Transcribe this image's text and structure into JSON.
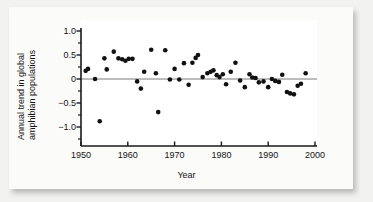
{
  "figure": {
    "background_color": "#f2f2f0",
    "card_color": "#fbfbfa",
    "plot_background": "#ffffff",
    "marker_color": "#111111",
    "axis_color": "#1a1a1a",
    "zero_line_color": "#7a7a7a"
  },
  "chart_data": {
    "type": "scatter",
    "title": "",
    "xlabel": "Year",
    "ylabel": "Annual trend in global amphibian populations",
    "xlim": [
      1950,
      2000
    ],
    "ylim": [
      -1.25,
      1.05
    ],
    "xticks": [
      1950,
      1960,
      1970,
      1980,
      1990,
      2000
    ],
    "xticklabels": [
      "1950",
      "1960",
      "1970",
      "1980",
      "1990",
      "2000"
    ],
    "yticks": [
      1.0,
      0.5,
      0,
      -0.5,
      -1.0
    ],
    "yticklabels": [
      "1.0",
      "0.5",
      "0",
      "−0.5",
      "−1.0"
    ],
    "y_minor_ticks": [
      0.75,
      0.25,
      -0.25,
      -0.75
    ],
    "grid": false,
    "legend": null,
    "reference_lines": [
      {
        "type": "horizontal",
        "y": 0,
        "color": "#7a7a7a"
      }
    ],
    "marker": {
      "shape": "circle",
      "size": 4.6,
      "color": "#111111"
    },
    "series": [
      {
        "name": "Annual trend in global amphibian populations",
        "x": [
          1951,
          1951.5,
          1953,
          1954,
          1955,
          1955.5,
          1957,
          1958,
          1958.8,
          1959.5,
          1960.2,
          1961,
          1962,
          1962.8,
          1963.5,
          1965,
          1966,
          1966.5,
          1968,
          1969,
          1970,
          1971,
          1972,
          1973,
          1973.8,
          1974.5,
          1975,
          1976,
          1977,
          1977.7,
          1978.3,
          1979,
          1979.6,
          1980.3,
          1981,
          1982,
          1983,
          1984,
          1985,
          1986,
          1986.6,
          1987.3,
          1988,
          1989,
          1990,
          1990.8,
          1991.5,
          1992.3,
          1993,
          1994,
          1994.7,
          1995.5,
          1996.3,
          1997,
          1998
        ],
        "y": [
          0.17,
          0.21,
          0.0,
          -0.88,
          0.43,
          0.2,
          0.57,
          0.43,
          0.41,
          0.38,
          0.42,
          0.42,
          -0.05,
          -0.2,
          0.15,
          0.61,
          0.12,
          -0.69,
          0.6,
          -0.01,
          0.21,
          -0.01,
          0.33,
          -0.12,
          0.34,
          0.44,
          0.5,
          0.04,
          0.12,
          0.15,
          0.18,
          0.08,
          0.04,
          0.1,
          -0.11,
          0.15,
          0.34,
          -0.03,
          -0.17,
          0.1,
          0.03,
          0.02,
          -0.07,
          -0.05,
          -0.17,
          0.0,
          -0.04,
          -0.06,
          0.09,
          -0.27,
          -0.3,
          -0.32,
          -0.14,
          -0.1,
          0.12
        ]
      }
    ]
  },
  "axes": {
    "ylabel_line1": "Annual trend in global",
    "ylabel_line2": "amphibian populations",
    "xlabel": "Year"
  }
}
